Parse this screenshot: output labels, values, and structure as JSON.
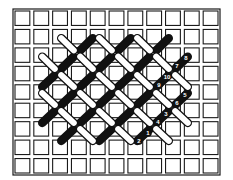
{
  "diagram": {
    "canvas": {
      "columns": 11,
      "rows": 9,
      "frame": {
        "x": 13,
        "y": 9,
        "width": 207,
        "height": 166
      },
      "frame_color": "#1a1a1a",
      "background_color": "#ffffff"
    },
    "lattice": {
      "x_nodes": [
        39,
        58,
        77,
        96,
        115,
        134,
        153,
        172,
        191
      ],
      "y_nodes": [
        35,
        53.5,
        72,
        90,
        108,
        126,
        144
      ]
    },
    "stitch_colors": {
      "white": "#ffffff",
      "black": "#111111",
      "outline": "#111111"
    },
    "stitches": {
      "white": [
        [
          [
            1,
            0
          ],
          [
            2,
            1
          ]
        ],
        [
          [
            3,
            0
          ],
          [
            4,
            1
          ]
        ],
        [
          [
            5,
            0
          ],
          [
            6,
            1
          ]
        ],
        [
          [
            0,
            1
          ],
          [
            1,
            2
          ]
        ],
        [
          [
            2,
            1
          ],
          [
            3,
            2
          ]
        ],
        [
          [
            4,
            1
          ],
          [
            5,
            2
          ]
        ],
        [
          [
            6,
            1
          ],
          [
            7,
            2
          ]
        ],
        [
          [
            1,
            2
          ],
          [
            2,
            3
          ]
        ],
        [
          [
            3,
            2
          ],
          [
            4,
            3
          ]
        ],
        [
          [
            5,
            2
          ],
          [
            6,
            3
          ]
        ],
        [
          [
            7,
            2
          ],
          [
            8,
            3
          ]
        ],
        [
          [
            0,
            3
          ],
          [
            1,
            4
          ]
        ],
        [
          [
            2,
            3
          ],
          [
            3,
            4
          ]
        ],
        [
          [
            4,
            3
          ],
          [
            5,
            4
          ]
        ],
        [
          [
            6,
            3
          ],
          [
            7,
            4
          ]
        ],
        [
          [
            1,
            4
          ],
          [
            2,
            5
          ]
        ],
        [
          [
            3,
            4
          ],
          [
            4,
            5
          ]
        ],
        [
          [
            5,
            4
          ],
          [
            6,
            5
          ]
        ],
        [
          [
            7,
            4
          ],
          [
            8,
            5
          ]
        ],
        [
          [
            2,
            5
          ],
          [
            3,
            6
          ]
        ],
        [
          [
            4,
            5
          ],
          [
            5,
            6
          ]
        ],
        [
          [
            6,
            5
          ],
          [
            7,
            6
          ]
        ]
      ],
      "black": [
        [
          [
            2,
            1
          ],
          [
            3,
            0
          ]
        ],
        [
          [
            4,
            1
          ],
          [
            5,
            0
          ]
        ],
        [
          [
            6,
            1
          ],
          [
            7,
            0
          ]
        ],
        [
          [
            1,
            2
          ],
          [
            2,
            1
          ]
        ],
        [
          [
            3,
            2
          ],
          [
            4,
            1
          ]
        ],
        [
          [
            5,
            2
          ],
          [
            6,
            1
          ]
        ],
        [
          [
            7,
            2
          ],
          [
            8,
            1
          ]
        ],
        [
          [
            0,
            3
          ],
          [
            1,
            2
          ]
        ],
        [
          [
            2,
            3
          ],
          [
            3,
            2
          ]
        ],
        [
          [
            4,
            3
          ],
          [
            5,
            2
          ]
        ],
        [
          [
            6,
            3
          ],
          [
            7,
            2
          ]
        ],
        [
          [
            1,
            4
          ],
          [
            2,
            3
          ]
        ],
        [
          [
            3,
            4
          ],
          [
            4,
            3
          ]
        ],
        [
          [
            5,
            4
          ],
          [
            6,
            3
          ]
        ],
        [
          [
            7,
            4
          ],
          [
            8,
            3
          ]
        ],
        [
          [
            0,
            5
          ],
          [
            1,
            4
          ]
        ],
        [
          [
            2,
            5
          ],
          [
            3,
            4
          ]
        ],
        [
          [
            4,
            5
          ],
          [
            5,
            4
          ]
        ],
        [
          [
            6,
            5
          ],
          [
            7,
            4
          ]
        ],
        [
          [
            1,
            6
          ],
          [
            2,
            5
          ]
        ],
        [
          [
            3,
            6
          ],
          [
            4,
            5
          ]
        ],
        [
          [
            5,
            6
          ],
          [
            6,
            5
          ]
        ]
      ]
    },
    "step_labels": [
      {
        "text": "1",
        "x": 148,
        "y": 133
      },
      {
        "text": "2",
        "x": 139,
        "y": 141
      },
      {
        "text": "3",
        "x": 166,
        "y": 114
      },
      {
        "text": "4",
        "x": 158,
        "y": 122
      },
      {
        "text": "5",
        "x": 185,
        "y": 95
      },
      {
        "text": "6",
        "x": 177,
        "y": 103
      },
      {
        "text": "7",
        "x": 177,
        "y": 66
      },
      {
        "text": "8",
        "x": 186,
        "y": 58
      },
      {
        "text": "9",
        "x": 159,
        "y": 85
      },
      {
        "text": "10",
        "x": 167,
        "y": 77
      }
    ]
  }
}
